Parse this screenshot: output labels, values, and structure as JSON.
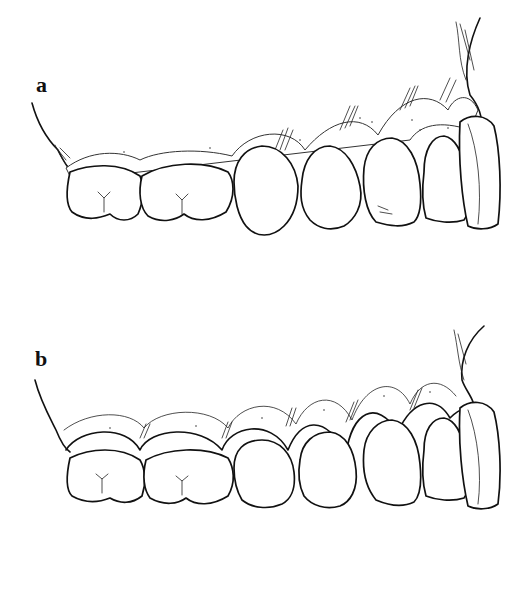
{
  "figure": {
    "panels": [
      {
        "id": "a",
        "label": "a",
        "description": "Upper dentition lateral view with gingiva — flat gingival contour"
      },
      {
        "id": "b",
        "label": "b",
        "description": "Upper dentition lateral view with gingiva — scalloped gingival contour"
      }
    ],
    "teeth_per_panel": 7,
    "colors": {
      "ink": "#111111",
      "background": "#ffffff"
    }
  }
}
